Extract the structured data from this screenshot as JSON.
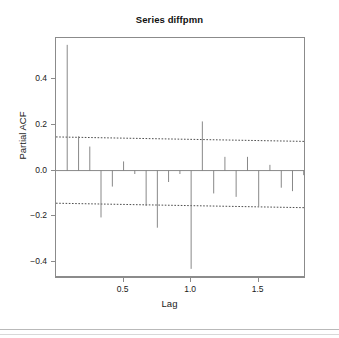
{
  "figure": {
    "title": "Series diffpmn",
    "background_color": "#ffffff",
    "axis_color": "#8b8b8b",
    "spike_color": "#7a7a7a",
    "conf_color": "#3a3a3a"
  },
  "axes": {
    "x_title": "Lag",
    "y_title": "Partial ACF",
    "x_ticks": [
      "0.5",
      "1.0",
      "1.5"
    ],
    "y_ticks": [
      "0.4",
      "0.2",
      "0.0",
      "-0.2",
      "-0.4"
    ]
  },
  "chart_data": {
    "type": "bar",
    "subtype": "pacf-spike-plot",
    "title": "Series diffpmn",
    "xlabel": "Lag",
    "ylabel": "Partial ACF",
    "xlim": [
      0.0,
      1.85
    ],
    "ylim": [
      -0.47,
      0.58
    ],
    "grid": false,
    "legend": null,
    "lag_unit": 0.0833,
    "x_tick_values": [
      0.5,
      1.0,
      1.5
    ],
    "x_tick_labels": [
      "0.5",
      "1.0",
      "1.5"
    ],
    "y_tick_values": [
      0.4,
      0.2,
      0.0,
      -0.2,
      -0.4
    ],
    "y_tick_labels": [
      "0.4",
      "0.2",
      "0.0",
      "-0.2",
      "-0.4"
    ],
    "confidence_band": {
      "upper": 0.145,
      "lower": -0.145,
      "style": "dashed",
      "note": "95% white-noise significance bounds"
    },
    "zero_line": 0.0,
    "x": [
      0.083,
      0.167,
      0.25,
      0.333,
      0.417,
      0.5,
      0.583,
      0.667,
      0.75,
      0.833,
      0.917,
      1.0,
      1.083,
      1.167,
      1.25,
      1.333,
      1.417,
      1.5,
      1.583,
      1.667,
      1.75,
      1.833
    ],
    "values": [
      0.55,
      0.15,
      0.105,
      -0.205,
      -0.07,
      0.04,
      -0.015,
      -0.155,
      -0.25,
      -0.05,
      -0.015,
      -0.43,
      0.215,
      -0.1,
      0.06,
      -0.115,
      0.06,
      -0.155,
      0.025,
      -0.075,
      -0.09,
      -0.02
    ],
    "lags": [
      1,
      2,
      3,
      4,
      5,
      6,
      7,
      8,
      9,
      10,
      11,
      12,
      13,
      14,
      15,
      16,
      17,
      18,
      19,
      20,
      21,
      22
    ]
  }
}
